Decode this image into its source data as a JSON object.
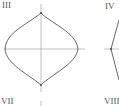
{
  "panels": [
    {
      "label": "III",
      "x": 2,
      "y": 0
    },
    {
      "label": "IV",
      "x": 105,
      "y": 1
    },
    {
      "label": "VII",
      "x": 1,
      "y": 96
    },
    {
      "label": "VIII",
      "x": 104,
      "y": 96
    }
  ],
  "colors": {
    "stroke": "#555555",
    "axis": "#888888",
    "text": "#555555"
  }
}
